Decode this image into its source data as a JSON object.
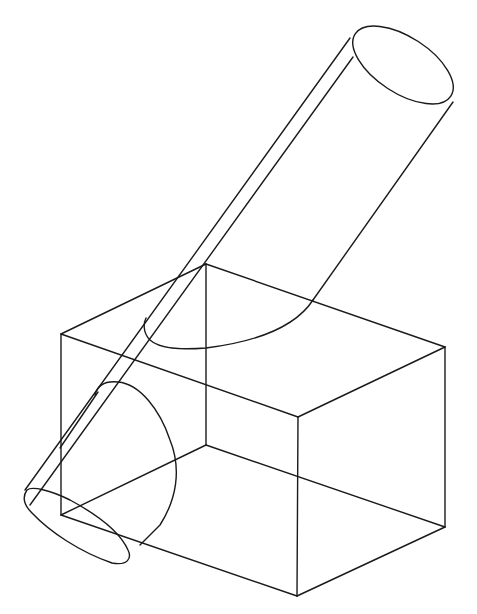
{
  "figure": {
    "colors": {
      "background": "#ffffff",
      "line": "#1a1a1a"
    }
  },
  "box": {
    "vertices": {
      "top_back": [
        206,
        264
      ],
      "top_left": [
        61,
        334
      ],
      "top_front": [
        298,
        417
      ],
      "top_right": [
        445,
        347
      ],
      "bottom_back": [
        206,
        445
      ],
      "bottom_left": [
        61,
        515
      ],
      "bottom_front": [
        297,
        596
      ],
      "bottom_right": [
        445,
        527
      ]
    }
  },
  "cylinder": {
    "top_ellipse_center": [
      403,
      65
    ],
    "bottom_ellipse_center": [
      78,
      530
    ]
  }
}
